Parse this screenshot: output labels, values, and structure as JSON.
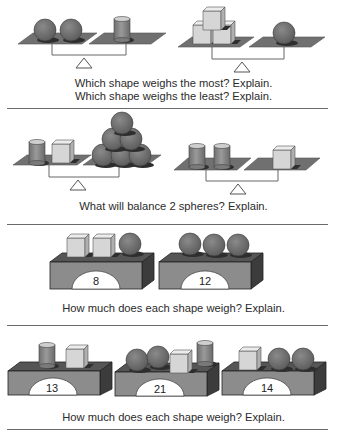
{
  "sections": [
    {
      "id": "compare-weights",
      "questions": [
        "Which shape weighs the most? Explain.",
        "Which shape weighs the least? Explain."
      ],
      "scales": [
        {
          "left": [
            "sphere",
            "sphere"
          ],
          "right": [
            "cylinder"
          ]
        },
        {
          "left": [
            "cube",
            "cube",
            "cube"
          ],
          "right": [
            "sphere"
          ]
        }
      ]
    },
    {
      "id": "balance-spheres",
      "questions": [
        "What will balance 2 spheres? Explain."
      ],
      "scales": [
        {
          "left": [
            "cylinder",
            "cube"
          ],
          "right": [
            "sphere",
            "sphere",
            "sphere",
            "sphere",
            "sphere",
            "sphere"
          ]
        },
        {
          "left": [
            "cylinder",
            "cylinder"
          ],
          "right": [
            "cube"
          ]
        }
      ]
    },
    {
      "id": "weigh-shapes-1",
      "questions": [
        "How much does each shape weigh? Explain."
      ],
      "boxes": [
        {
          "shapes": [
            "cube",
            "cube",
            "sphere"
          ],
          "reading": "8"
        },
        {
          "shapes": [
            "sphere",
            "sphere",
            "sphere"
          ],
          "reading": "12"
        }
      ]
    },
    {
      "id": "weigh-shapes-2",
      "questions": [
        "How much does each shape weigh? Explain."
      ],
      "boxes": [
        {
          "shapes": [
            "cylinder",
            "cube"
          ],
          "reading": "13"
        },
        {
          "shapes": [
            "sphere",
            "sphere",
            "cube",
            "cylinder"
          ],
          "reading": "21"
        },
        {
          "shapes": [
            "cube",
            "sphere",
            "sphere"
          ],
          "reading": "14"
        }
      ]
    }
  ],
  "colors": {
    "plate": "#707070",
    "sphere": "#6e6e6e",
    "cylinder": "#8a8a8a",
    "cube_front": "#d6d6d6",
    "cube_top": "#eaeaea",
    "box_front": "#8c8c8c",
    "box_side": "#3c3c3c",
    "box_top": "#555555",
    "separator": "#6a6a6a"
  }
}
